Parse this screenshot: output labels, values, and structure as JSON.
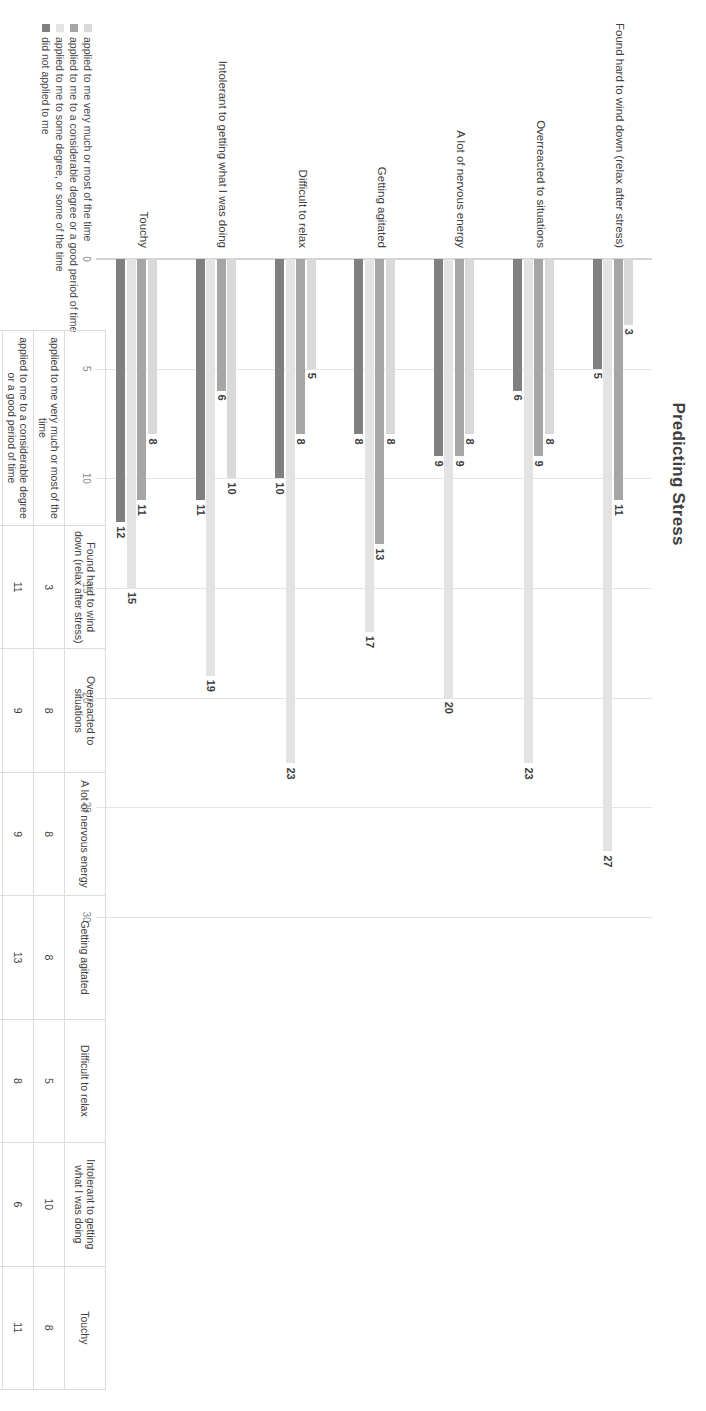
{
  "chart_data": {
    "type": "bar",
    "title": "Predicting Stress",
    "orientation": "vertical-grouped",
    "xlabel": "",
    "ylabel": "",
    "ylim": [
      0,
      30
    ],
    "yticks": [
      "0",
      "5",
      "10",
      "15",
      "20",
      "25",
      "30"
    ],
    "grid": true,
    "legend_position": "bottom-left",
    "categories": [
      "Found hard to wind down (relax after stress)",
      "Overreacted to situations",
      "A lot of nervous energy",
      "Getting agitated",
      "Difficult to relax",
      "Intolerant to getting what I was doing",
      "Touchy"
    ],
    "series": [
      {
        "name": "applied to me very much or most of the time",
        "color": "#d9d9d9",
        "values": [
          3,
          8,
          8,
          8,
          5,
          10,
          8
        ]
      },
      {
        "name": "applied to me to a considerable degree or a good period of time",
        "color": "#a6a6a6",
        "values": [
          11,
          9,
          9,
          13,
          8,
          6,
          11
        ]
      },
      {
        "name": "applied to me to some degree, or some of the time",
        "color": "#e3e3e3",
        "values": [
          27,
          23,
          20,
          17,
          23,
          19,
          15
        ]
      },
      {
        "name": "did not applied to me",
        "color": "#808080",
        "values": [
          5,
          6,
          9,
          8,
          10,
          11,
          12
        ]
      }
    ]
  },
  "legend": {
    "items": [
      {
        "label": "applied to me very much or most of the time",
        "color": "#d9d9d9"
      },
      {
        "label": "applied to me to a considerable degree or a good period of time",
        "color": "#a6a6a6"
      },
      {
        "label": "applied to me to some degree, or some of the time",
        "color": "#e3e3e3"
      },
      {
        "label": "did not applied to me",
        "color": "#808080"
      }
    ]
  },
  "table": {
    "corner": "",
    "columns": [
      "Found hard to wind down (relax after stress)",
      "Overreacted to situations",
      "A lot of nervous energy",
      "Getting agitated",
      "Difficult to relax",
      "Intolerant to getting what I was doing",
      "Touchy"
    ],
    "rows": [
      {
        "label": "applied to me very much or most of the time",
        "values": [
          "3",
          "8",
          "8",
          "8",
          "5",
          "10",
          "8"
        ]
      },
      {
        "label": "applied to me to a considerable degree or a good period of time",
        "values": [
          "11",
          "9",
          "9",
          "13",
          "8",
          "6",
          "11"
        ]
      },
      {
        "label": "applied to me to some degree, or some of the time",
        "values": [
          "27",
          "23",
          "20",
          "17",
          "23",
          "19",
          "15"
        ]
      },
      {
        "label": "did not applied to me",
        "values": [
          "5",
          "6",
          "9",
          "8",
          "10",
          "11",
          "12"
        ]
      }
    ]
  }
}
